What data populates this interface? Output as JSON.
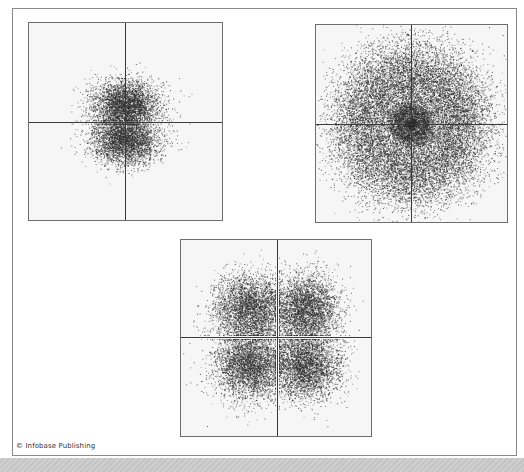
{
  "figure": {
    "copyright": "© Infobase Publishing",
    "colors": {
      "frame_border": "#8a8a8a",
      "panel_background": "#f6f6f6",
      "dots": "#2a2a2a",
      "axes": "#3a3a3a",
      "bottom_band": "#c8c8c8"
    },
    "panels": [
      {
        "id": "dumbbell-orbital",
        "shape": "two lobes along vertical axis",
        "box": {
          "x": 28,
          "y": 22,
          "w": 195,
          "h": 199
        },
        "axis_center": {
          "x": 96,
          "y": 99
        },
        "cloud": {
          "type": "p_lobes_vertical",
          "lobe_offset": 18,
          "sigma_x": 17,
          "sigma_y": 12,
          "count": 7000,
          "seed": 11
        }
      },
      {
        "id": "concentric-rings-orbital",
        "shape": "nucleus dot with concentric shells",
        "box": {
          "x": 315,
          "y": 24,
          "w": 193,
          "h": 199
        },
        "axis_center": {
          "x": 95,
          "y": 99
        },
        "cloud": {
          "type": "s_rings",
          "rings": [
            {
              "r": 4,
              "width": 2.5,
              "count": 500
            },
            {
              "r": 15,
              "width": 4.5,
              "count": 2200
            },
            {
              "r": 52,
              "width": 20,
              "count": 16000
            }
          ],
          "seed": 23
        }
      },
      {
        "id": "cloverleaf-orbital",
        "shape": "four lobes between axes",
        "box": {
          "x": 180,
          "y": 239,
          "w": 192,
          "h": 198
        },
        "axis_center": {
          "x": 96,
          "y": 97
        },
        "cloud": {
          "type": "d_clover",
          "lobe_offset": 30,
          "sigma": 17,
          "count": 14000,
          "seed": 37
        }
      }
    ]
  }
}
